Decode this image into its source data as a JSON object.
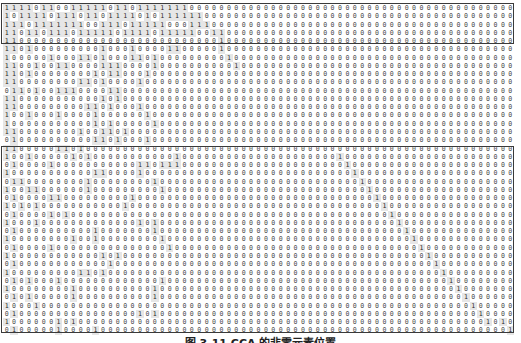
{
  "figure": {
    "caption": "图 3-11  CCA 的非零元素位置",
    "columns": 69,
    "regions": [
      {
        "name": "upper-block",
        "rows": [
          0,
          4
        ]
      },
      {
        "name": "lower-block",
        "rows": [
          17,
          39
        ]
      }
    ],
    "matrix_rows": [
      "111101100111110110111111100000000000000000000000000000000000000000000",
      "101111011101101111010111111000000000000000000000000000000000000000000",
      "111011111110011101111100011100000000000000000000000000000000000000000",
      "110110111011111011110111110011000000000000000000000000000000000000000",
      "110000000000000000000000000001000000000000000000000000000000000000000",
      "110100000000010001000011000001000000000000000000000000000000000000000",
      "100000100011010001101000000000100000000000000000000000000000000000000",
      "110010011000011100001000000000010000000000000000000000000000000000000",
      "110100000000101100010000000000000000000000000000000000000000000000000",
      "110000000011010000100000000000000000000000000000000000000000000000000",
      "011010011100001100000000000000000000000000000000000000000000000000000",
      "110000000000010100000000000000000000000000000000000000000000000000000",
      "110000000001101000100000000000000000000000000000000000000000000000000",
      "100100010000100000010000000000000000000000000000000000000000000000000",
      "100000000000101000001000000000000000000000000000000000000000000000000",
      "110000000010011010000000000000000000000000000000000000000000000000000",
      "010000000000110100010000000000000000000000000000000000000000000000000",
      "110000011010000000000000000000000000000000000000000000000000000000000",
      "100100000101000000000001000000000000000000000100000000000000000000000",
      "010000100000000000110111000000000000000000000010000000000000000000000",
      "100000000000110000100000000000000000000000000001000000000000000000000",
      "011000000001000000001000000000000000000000000000100000000000000000000",
      "100110000001000000000100000000000000000000000000010000000000000000000",
      "010000110000000001000000000000000000000000000000001000000000000000000",
      "101010000000000010000000000000000000000000000000000100000000000000000",
      "010000101000000000000000000000000000000000000000000010000000000000000",
      "100010000000000000101000000000000000000000000000000001000000000000000",
      "010000000000100000001000000000000000000000000000000000100000000000000",
      "100000000100100000000100000000000000000000000000000000010000000000000",
      "010000100000000000000010000000000000000000000000000000001000000000000",
      "100000000000010100000000000000000000000000000000000000000100000000000",
      "010000000000001000000000000000000000000000000000000000000010000000000",
      "100000000011010000000000000000000000000000000000000000000001000000000",
      "010100010000000000000100000000000000000000000000000000000000100000000",
      "100000000100000000001000000000000000000000000000000000000000010000000",
      "010100000100000000001000000000000000000000000000000000000000001000000",
      "100010000000000000000000000000000000000000000000000000000000000100000",
      "010000000000000000101000000000000000000000000000000000000000000010000",
      "100000010100000000000000000000000000000000000000000000000000000001010",
      "010000010000100000000000000000000000000000000000000000000000000000001"
    ]
  }
}
